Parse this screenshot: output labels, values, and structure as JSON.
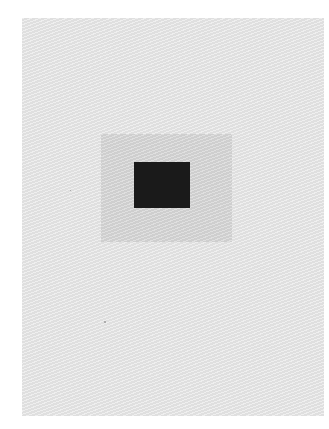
{
  "image": {
    "description": "Concentric squares print: dark square centered inside a mid-gray square on a light gray sheet",
    "colors": {
      "page_background": "#ffffff",
      "sheet": "#e6e6e6",
      "middle_square": "#d5d5d5",
      "inner_square": "#1a1a1a"
    }
  }
}
